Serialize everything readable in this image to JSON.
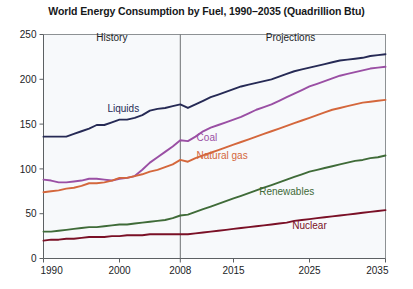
{
  "chart_data": {
    "type": "line",
    "title": "World Energy Consumption by Fuel, 1990–2035 (Quadrillion Btu)",
    "xlabel": "",
    "ylabel": "",
    "xlim": [
      1990,
      2035
    ],
    "ylim": [
      0,
      250
    ],
    "ytick_labels": [
      "0",
      "50",
      "100",
      "150",
      "200",
      "250"
    ],
    "yticks": [
      0,
      50,
      100,
      150,
      200,
      250
    ],
    "xtick_labels": [
      "1990",
      "2000",
      "2008",
      "2015",
      "2025",
      "2035"
    ],
    "xticks": [
      1990,
      2000,
      2008,
      2015,
      2025,
      2035
    ],
    "grid": false,
    "legend_position": "inline-annotations",
    "annotations": [
      {
        "text": "History",
        "x": 1999,
        "y": 243
      },
      {
        "text": "Projections",
        "x": 2022.5,
        "y": 243
      }
    ],
    "divider_year": 2008,
    "x": [
      1990,
      1991,
      1992,
      1993,
      1994,
      1995,
      1996,
      1997,
      1998,
      1999,
      2000,
      2001,
      2002,
      2003,
      2004,
      2005,
      2006,
      2007,
      2008,
      2009,
      2010,
      2011,
      2012,
      2013,
      2014,
      2015,
      2016,
      2017,
      2018,
      2019,
      2020,
      2021,
      2022,
      2023,
      2024,
      2025,
      2026,
      2027,
      2028,
      2029,
      2030,
      2031,
      2032,
      2033,
      2034,
      2035
    ],
    "series": [
      {
        "name": "Liquids",
        "color": "#262a55",
        "label_x": 2000.5,
        "label_y": 163,
        "values": [
          136,
          136,
          136,
          136,
          139,
          142,
          145,
          149,
          149,
          152,
          155,
          155,
          157,
          160,
          165,
          167,
          168,
          170,
          172,
          168,
          172,
          176,
          180,
          183,
          186,
          189,
          192,
          194,
          196,
          198,
          200,
          203,
          206,
          209,
          211,
          213,
          215,
          217,
          219,
          221,
          222,
          223,
          224,
          226,
          227,
          228
        ]
      },
      {
        "name": "Coal",
        "color": "#9a4fa4",
        "label_x": 2011.5,
        "label_y": 131,
        "values": [
          88,
          87,
          85,
          85,
          86,
          87,
          89,
          89,
          88,
          87,
          89,
          90,
          92,
          99,
          107,
          113,
          119,
          125,
          132,
          131,
          136,
          142,
          146,
          149,
          152,
          155,
          158,
          162,
          166,
          169,
          172,
          176,
          180,
          184,
          188,
          192,
          195,
          198,
          201,
          204,
          206,
          208,
          210,
          212,
          213,
          214
        ]
      },
      {
        "name": "Natural gas",
        "color": "#d4673c",
        "label_x": 2013.5,
        "label_y": 111,
        "values": [
          74,
          75,
          76,
          78,
          79,
          81,
          84,
          84,
          85,
          87,
          90,
          90,
          92,
          94,
          97,
          99,
          102,
          105,
          110,
          108,
          112,
          115,
          118,
          121,
          124,
          127,
          130,
          133,
          136,
          139,
          142,
          145,
          148,
          151,
          154,
          157,
          160,
          163,
          166,
          168,
          170,
          172,
          174,
          175,
          176,
          177
        ]
      },
      {
        "name": "Renewables",
        "color": "#3f6b38",
        "label_x": 2022,
        "label_y": 71,
        "values": [
          30,
          30,
          31,
          32,
          33,
          34,
          35,
          35,
          36,
          37,
          38,
          38,
          39,
          40,
          41,
          42,
          43,
          45,
          48,
          49,
          52,
          55,
          58,
          61,
          64,
          67,
          70,
          73,
          76,
          79,
          82,
          85,
          88,
          91,
          94,
          97,
          99,
          101,
          103,
          105,
          107,
          109,
          110,
          112,
          113,
          115
        ]
      },
      {
        "name": "Nuclear",
        "color": "#7a1026",
        "label_x": 2025,
        "label_y": 33,
        "values": [
          20,
          21,
          21,
          22,
          22,
          23,
          24,
          24,
          24,
          25,
          25,
          26,
          26,
          26,
          27,
          27,
          27,
          27,
          27,
          27,
          28,
          29,
          30,
          31,
          32,
          33,
          34,
          35,
          36,
          37,
          38,
          39,
          40,
          42,
          43,
          44,
          45,
          46,
          47,
          48,
          49,
          50,
          51,
          52,
          53,
          54
        ]
      }
    ]
  }
}
